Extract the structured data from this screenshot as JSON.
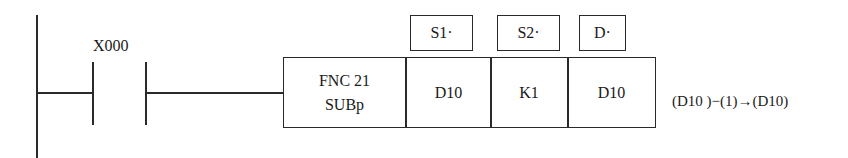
{
  "diagram": {
    "type": "ladder-logic",
    "contact": {
      "label": "X000",
      "kind": "normally-open"
    },
    "instruction": {
      "function_line1": "FNC 21",
      "function_line2": "SUBp",
      "operands": [
        {
          "header": "S1·",
          "value": "D10"
        },
        {
          "header": "S2·",
          "value": "K1"
        },
        {
          "header": "D·",
          "value": "D10"
        }
      ]
    },
    "equation": "(D10 )−(1)→(D10)",
    "colors": {
      "line": "#2a2a2a",
      "background": "#ffffff"
    }
  }
}
